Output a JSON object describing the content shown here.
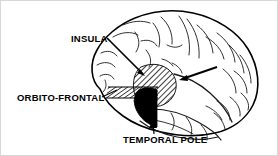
{
  "figure": {
    "kind": "anatomical-diagram",
    "background_color": "#ffffff",
    "ink_color": "#000000",
    "border_color": "#d8d8d8"
  },
  "labels": {
    "insula": "INSULA",
    "orbito_frontal": "ORBITO-FRONTAL",
    "temporal_pole": "TEMPORAL POLE"
  },
  "regions": [
    {
      "id": "insula",
      "label": "INSULA",
      "fill": "diagonal-hatch",
      "fill_color": "#000000",
      "shape": "oval"
    },
    {
      "id": "orbito-frontal",
      "label": "ORBITO-FRONTAL",
      "fill": "diagonal-hatch",
      "fill_color": "#000000",
      "shape": "horizontal-band"
    },
    {
      "id": "temporal-pole",
      "label": "TEMPORAL POLE",
      "fill": "solid",
      "fill_color": "#000000",
      "shape": "rounded-wedge"
    }
  ],
  "leader_lines": [
    {
      "id": "insula-leader",
      "from": "INSULA",
      "to": "insula",
      "arrowhead": true
    },
    {
      "id": "insula-leader-right",
      "from": "insula-right",
      "to": "insula",
      "arrowhead": true
    },
    {
      "id": "orbito-frontal-leader",
      "from": "ORBITO-FRONTAL",
      "to": "orbito-frontal",
      "arrowhead": false
    },
    {
      "id": "temporal-pole-leader",
      "from": "TEMPORAL POLE",
      "to": "temporal-pole",
      "arrowhead": true
    }
  ]
}
